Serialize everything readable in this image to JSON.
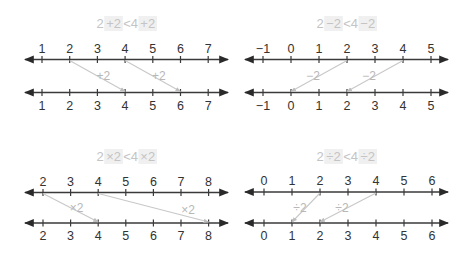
{
  "colors": {
    "axis": "#3a3a3a",
    "arrow": "#c8c8c8",
    "op_label": "#b8b8b8",
    "title_text": "#c4c4c4",
    "title_highlight": "#f0f0f0"
  },
  "panels": [
    {
      "id": "add",
      "title": {
        "left": "2",
        "op1": "+2",
        "lt": "<4",
        "op2": "+2"
      },
      "ticks": [
        "1",
        "2",
        "3",
        "4",
        "5",
        "6",
        "7"
      ],
      "x0": 42,
      "dx": 27.7,
      "y_top": 59.5,
      "y_bot": 92.5,
      "x_min": 25,
      "x_max": 228,
      "title_y": 26,
      "arrows": [
        {
          "from_index": 1,
          "to_index": 3,
          "label": "+2"
        },
        {
          "from_index": 3,
          "to_index": 5,
          "label": "+2"
        }
      ]
    },
    {
      "id": "subtract",
      "title": {
        "left": "2",
        "op1": "−2",
        "lt": "<4",
        "op2": "−2"
      },
      "ticks": [
        "−1",
        "0",
        "1",
        "2",
        "3",
        "4",
        "5"
      ],
      "x0": 263,
      "dx": 28,
      "y_top": 59.5,
      "y_bot": 92.5,
      "x_min": 245,
      "x_max": 448,
      "title_y": 26,
      "arrows": [
        {
          "from_index": 3,
          "to_index": 1,
          "label": "−2"
        },
        {
          "from_index": 5,
          "to_index": 3,
          "label": "−2"
        }
      ]
    },
    {
      "id": "multiply",
      "title": {
        "left": "2",
        "op1": "×2",
        "lt": "<4",
        "op2": "×2"
      },
      "ticks": [
        "2",
        "3",
        "4",
        "5",
        "6",
        "7",
        "8"
      ],
      "x0": 43,
      "dx": 27.6,
      "y_top": 192.5,
      "y_bot": 223,
      "x_min": 25,
      "x_max": 228,
      "title_y": 159,
      "arrows": [
        {
          "from_index": 0,
          "to_index": 2,
          "label": "×2"
        },
        {
          "from_index": 2,
          "to_index": 6,
          "label": "×2"
        }
      ]
    },
    {
      "id": "divide",
      "title": {
        "left": "2",
        "op1": "÷2",
        "lt": "<4",
        "op2": "÷2"
      },
      "ticks": [
        "0",
        "1",
        "2",
        "3",
        "4",
        "5",
        "6"
      ],
      "x0": 264,
      "dx": 28,
      "y_top": 192,
      "y_bot": 223,
      "x_min": 245,
      "x_max": 448,
      "title_y": 159,
      "arrows": [
        {
          "from_index": 2,
          "to_index": 1,
          "label": "÷2"
        },
        {
          "from_index": 4,
          "to_index": 2,
          "label": "÷2"
        }
      ]
    }
  ]
}
